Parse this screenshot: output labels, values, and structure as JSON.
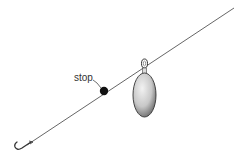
{
  "diagram": {
    "labels": {
      "stop": "stop"
    },
    "components": [
      "line",
      "hook",
      "stop",
      "sinker"
    ],
    "colors": {
      "line": "#555555",
      "stop": "#111111",
      "sinker_light": "#e8e8e8",
      "sinker_dark": "#6a6a6a",
      "outline": "#333333"
    }
  }
}
